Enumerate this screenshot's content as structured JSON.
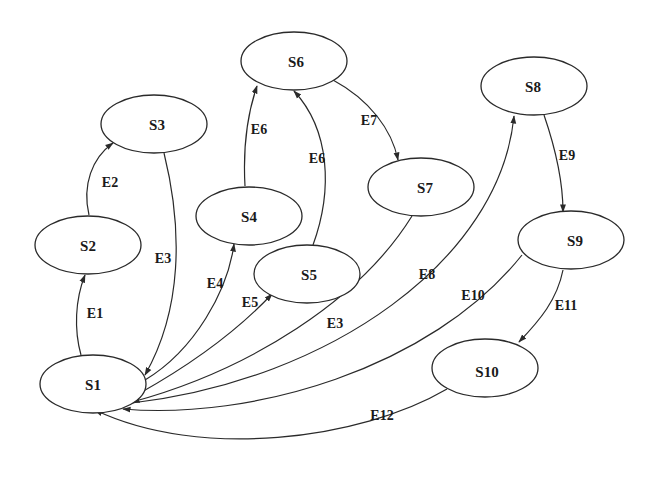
{
  "diagram": {
    "type": "state-transition-graph",
    "nodes": [
      {
        "id": "S1",
        "label": "S1",
        "cx": 93,
        "cy": 384
      },
      {
        "id": "S2",
        "label": "S2",
        "cx": 88,
        "cy": 245
      },
      {
        "id": "S3",
        "label": "S3",
        "cx": 157,
        "cy": 124
      },
      {
        "id": "S4",
        "label": "S4",
        "cx": 249,
        "cy": 215
      },
      {
        "id": "S5",
        "label": "S5",
        "cx": 308,
        "cy": 274
      },
      {
        "id": "S6",
        "label": "S6",
        "cx": 293,
        "cy": 62
      },
      {
        "id": "S7",
        "label": "S7",
        "cx": 425,
        "cy": 187
      },
      {
        "id": "S8",
        "label": "S8",
        "cx": 534,
        "cy": 86
      },
      {
        "id": "S9",
        "label": "S9",
        "cx": 571,
        "cy": 241
      },
      {
        "id": "S10",
        "label": "S10",
        "cx": 485,
        "cy": 371
      }
    ],
    "edges": [
      {
        "label": "E1",
        "from": "S1",
        "to": "S2"
      },
      {
        "label": "E2",
        "from": "S2",
        "to": "S3"
      },
      {
        "label": "E3",
        "from": "S3",
        "to": "S1"
      },
      {
        "label": "E4",
        "from": "S1",
        "to": "S4"
      },
      {
        "label": "E5",
        "from": "S1",
        "to": "S5"
      },
      {
        "label": "E6",
        "from": "S4",
        "to": "S6"
      },
      {
        "label": "E6",
        "from": "S5",
        "to": "S6"
      },
      {
        "label": "E7",
        "from": "S6",
        "to": "S7"
      },
      {
        "label": "E3",
        "from": "S7",
        "to": "S1"
      },
      {
        "label": "E8",
        "from": "S1",
        "to": "S8"
      },
      {
        "label": "E9",
        "from": "S8",
        "to": "S9"
      },
      {
        "label": "E10",
        "from": "S9",
        "to": "S1"
      },
      {
        "label": "E11",
        "from": "S9",
        "to": "S10"
      },
      {
        "label": "E12",
        "from": "S10",
        "to": "S1"
      }
    ]
  },
  "labels": {
    "nodes": {
      "s1": "S1",
      "s2": "S2",
      "s3": "S3",
      "s4": "S4",
      "s5": "S5",
      "s6": "S6",
      "s7": "S7",
      "s8": "S8",
      "s9": "S9",
      "s10": "S10"
    },
    "edges": {
      "e1": "E1",
      "e2": "E2",
      "e3a": "E3",
      "e4": "E4",
      "e5": "E5",
      "e6a": "E6",
      "e6b": "E6",
      "e7": "E7",
      "e3b": "E3",
      "e8": "E8",
      "e9": "E9",
      "e10": "E10",
      "e11": "E11",
      "e12": "E12"
    }
  },
  "colors": {
    "stroke": "#2a2a2a",
    "background": "#ffffff",
    "text": "#1a1a1a"
  }
}
